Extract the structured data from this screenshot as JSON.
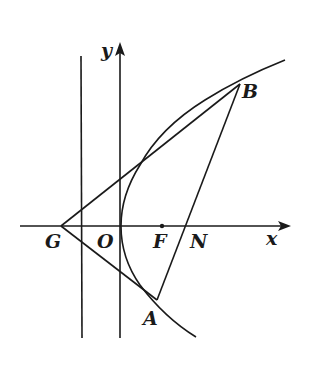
{
  "diagram": {
    "type": "parabola-geometry",
    "colors": {
      "stroke": "#1a1a1a",
      "background": "#ffffff"
    },
    "axes": {
      "x_label": "x",
      "y_label": "y"
    },
    "points": {
      "G": "G",
      "O": "O",
      "F": "F",
      "N": "N",
      "A": "A",
      "B": "B"
    },
    "elements": [
      "parabola opening right with vertex at origin O",
      "focus F on the positive x-axis",
      "vertical line through G-side (directrix-like line) left of y-axis",
      "vertical line x = 0 (y-axis)",
      "segment G to B (tangent to parabola)",
      "segment G to A",
      "segment A to B passing through N on x-axis"
    ]
  }
}
